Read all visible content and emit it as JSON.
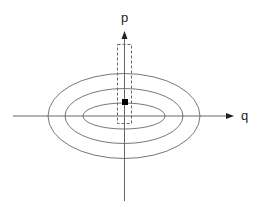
{
  "diagram": {
    "type": "phase-space contour plot",
    "axes": {
      "horizontal": {
        "label": "q"
      },
      "vertical": {
        "label": "p"
      }
    },
    "contours": [
      {
        "name": "inner-ellipse",
        "cx": 124,
        "cy": 116,
        "rx": 41,
        "ry": 13
      },
      {
        "name": "middle-ellipse",
        "cx": 124,
        "cy": 116,
        "rx": 59,
        "ry": 27.5
      },
      {
        "name": "outer-ellipse",
        "cx": 124,
        "cy": 116,
        "rx": 76,
        "ry": 42.5
      }
    ],
    "marker": {
      "shape": "filled-square",
      "x": 122,
      "y": 99,
      "size": 6
    },
    "region": {
      "shape": "dashed-rectangle",
      "x": 117,
      "y": 44,
      "width": 14,
      "height": 79
    },
    "colors": {
      "lines": "#666666",
      "axes": "#555555",
      "marker": "#000000",
      "arrow": "#222222"
    }
  }
}
